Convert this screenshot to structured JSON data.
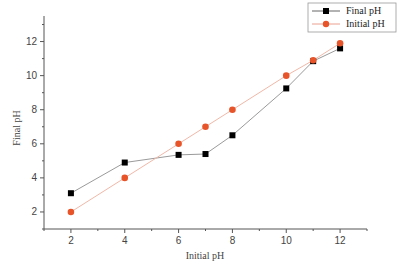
{
  "chart_data": {
    "type": "line",
    "title": "",
    "xlabel": "Initial pH",
    "ylabel": "Final pH",
    "xlim": [
      1,
      13
    ],
    "ylim": [
      1,
      13.5
    ],
    "xticks": [
      2,
      4,
      6,
      8,
      10,
      12
    ],
    "yticks": [
      2,
      4,
      6,
      8,
      10,
      12
    ],
    "grid": false,
    "legend_position": "top-right",
    "series": [
      {
        "name": "Final pH",
        "marker": "square",
        "color": "#000000",
        "line_color": "#9a9a9a",
        "x": [
          2,
          4,
          6,
          7,
          8,
          10,
          11,
          12
        ],
        "y": [
          3.1,
          4.9,
          5.35,
          5.4,
          6.5,
          9.25,
          10.85,
          11.6
        ]
      },
      {
        "name": "Initial pH",
        "marker": "circle",
        "color": "#e8542a",
        "line_color": "#f0b8a8",
        "x": [
          2,
          4,
          6,
          7,
          8,
          10,
          11,
          12
        ],
        "y": [
          2.0,
          4.0,
          6.0,
          7.0,
          8.0,
          10.0,
          10.9,
          11.9
        ]
      }
    ]
  }
}
